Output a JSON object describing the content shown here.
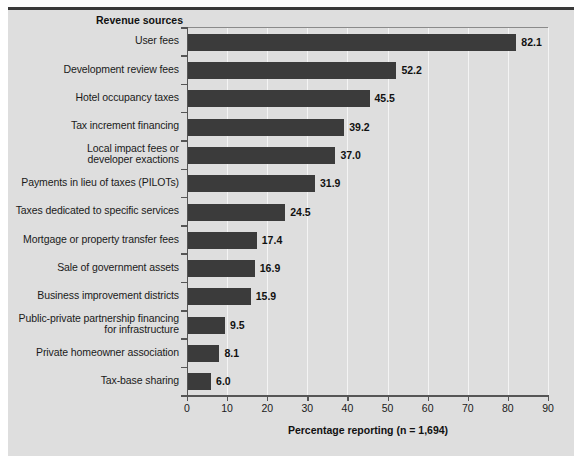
{
  "chart_data": {
    "type": "bar",
    "orientation": "horizontal",
    "title": "",
    "xlabel": "Percentage reporting (n = 1,694)",
    "ylabel": "Revenue sources",
    "xlim": [
      0,
      90
    ],
    "xticks": [
      0,
      10,
      20,
      30,
      40,
      50,
      60,
      70,
      80,
      90
    ],
    "xtick_labels": [
      "0",
      "10",
      "20",
      "30",
      "40",
      "50",
      "60",
      "70",
      "80",
      "90"
    ],
    "grid": "vertical-only",
    "legend": "none",
    "categories": [
      "User fees",
      "Development review fees",
      "Hotel occupancy taxes",
      "Tax increment financing",
      "Local impact fees or\ndeveloper exactions",
      "Payments in lieu of taxes (PILOTs)",
      "Taxes dedicated to specific services",
      "Mortgage or property transfer fees",
      "Sale of government assets",
      "Business improvement districts",
      "Public-private partnership financing\nfor infrastructure",
      "Private homeowner association",
      "Tax-base sharing"
    ],
    "values": [
      82.1,
      52.2,
      45.5,
      39.2,
      37.0,
      31.9,
      24.5,
      17.4,
      16.9,
      15.9,
      9.5,
      8.1,
      6.0
    ],
    "value_labels": [
      "82.1",
      "52.2",
      "45.5",
      "39.2",
      "37.0",
      "31.9",
      "24.5",
      "17.4",
      "16.9",
      "15.9",
      "9.5",
      "8.1",
      "6.0"
    ]
  },
  "colors": {
    "bar": "#3b3b3b",
    "panel_background": "#dedede",
    "gridline": "#f4f4f4",
    "axis": "#555555",
    "text": "#1a1a1a",
    "figure_background": "#ffffff"
  }
}
